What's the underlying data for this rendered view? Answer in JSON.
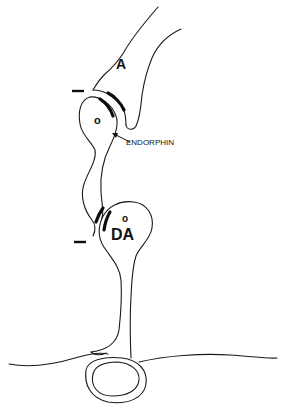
{
  "diagram": {
    "type": "neuron-synapse-schematic",
    "labels": {
      "neuron_a": "A",
      "opioid_neuron_marker": "o",
      "endorphin": "ENDORPHIN",
      "dopamine_marker": "o",
      "dopamine_neuron": "DA",
      "inhibition_top": "—",
      "inhibition_bottom": "—"
    },
    "colors": {
      "line": "#1a1a1a",
      "background": "#ffffff"
    }
  }
}
